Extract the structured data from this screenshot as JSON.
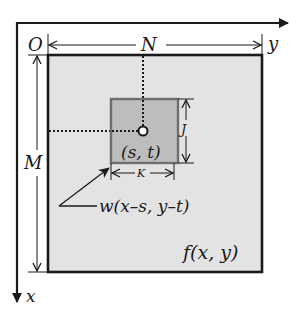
{
  "diagram": {
    "origin_label": "O",
    "x_axis_label": "x",
    "y_axis_label": "y",
    "width_label": "N",
    "height_label": "M",
    "window_height_label": "J",
    "window_width_label": "K",
    "center_label": "(s, t)",
    "mask_label": "w(x–s, y–t)",
    "image_label": "f(x, y)"
  },
  "colors": {
    "image_fill": "#e3e3e3",
    "window_fill": "#bdbdbd",
    "window_border": "#6e6e6e",
    "line": "#1a1a1a"
  }
}
